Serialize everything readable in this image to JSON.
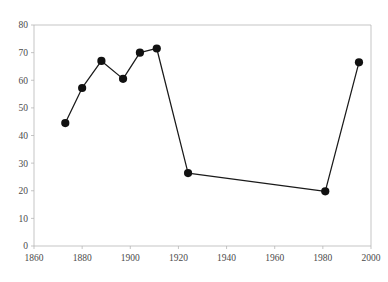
{
  "chart_data": {
    "type": "line",
    "title": "",
    "xlabel": "",
    "ylabel": "",
    "xlim": [
      1860,
      2000
    ],
    "ylim": [
      0,
      80
    ],
    "xticks": [
      1860,
      1880,
      1900,
      1920,
      1940,
      1960,
      1980,
      2000
    ],
    "xtick_labels": [
      "1860",
      "1880",
      "1900",
      "1920",
      "1940",
      "1960",
      "1980",
      "2000"
    ],
    "yticks": [
      0,
      10,
      20,
      30,
      40,
      50,
      60,
      70,
      80
    ],
    "ytick_labels": [
      "0",
      "10",
      "20",
      "30",
      "40",
      "50",
      "60",
      "70",
      "80"
    ],
    "grid": false,
    "legend": null,
    "marker": "filled-circle",
    "marker_color": "#111111",
    "line_color": "#1a1a1a",
    "axis_color": "#b6b6b6",
    "background": "#ffffff",
    "x": [
      1873,
      1880,
      1888,
      1897,
      1904,
      1911,
      1924,
      1981,
      1995
    ],
    "values": [
      44.5,
      57.2,
      67.0,
      60.5,
      70.0,
      71.5,
      26.4,
      19.8,
      66.5
    ],
    "points": [
      {
        "x": 1873,
        "y": 44.5
      },
      {
        "x": 1880,
        "y": 57.2
      },
      {
        "x": 1888,
        "y": 67.0
      },
      {
        "x": 1897,
        "y": 60.5
      },
      {
        "x": 1904,
        "y": 70.0
      },
      {
        "x": 1911,
        "y": 71.5
      },
      {
        "x": 1924,
        "y": 26.4
      },
      {
        "x": 1981,
        "y": 19.8
      },
      {
        "x": 1995,
        "y": 66.5
      }
    ]
  },
  "plot": {
    "left": 34,
    "right": 371,
    "top": 25,
    "bottom": 246
  }
}
